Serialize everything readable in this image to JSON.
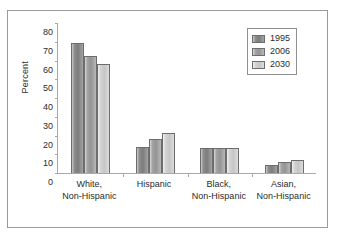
{
  "chart_data": {
    "type": "bar",
    "title": "",
    "xlabel": "",
    "ylabel": "Percent",
    "ylim": [
      0,
      80
    ],
    "yticks": [
      0,
      10,
      20,
      30,
      40,
      50,
      60,
      70,
      80
    ],
    "grid": false,
    "legend_position": "top-right",
    "categories": [
      "White,\nNon-Hispanic",
      "Hispanic",
      "Black,\nNon-Hispanic",
      "Asian,\nNon-Hispanic"
    ],
    "category_lines": [
      [
        "White,",
        "Non-Hispanic"
      ],
      [
        "Hispanic",
        ""
      ],
      [
        "Black,",
        "Non-Hispanic"
      ],
      [
        "Asian,",
        "Non-Hispanic"
      ]
    ],
    "series": [
      {
        "name": "1995",
        "color": "#7c7c7c",
        "values": [
          69,
          14,
          13,
          4
        ]
      },
      {
        "name": "2006",
        "color": "#949494",
        "values": [
          62,
          18,
          13,
          6
        ]
      },
      {
        "name": "2030",
        "color": "#c6c6c6",
        "values": [
          58,
          21,
          13,
          7
        ]
      }
    ]
  },
  "axis": {
    "y_title": "Percent",
    "y_tick_labels": [
      "80",
      "70",
      "60",
      "50",
      "40",
      "30",
      "20",
      "10",
      "0"
    ]
  },
  "legend": {
    "entries": [
      {
        "label": "1995"
      },
      {
        "label": "2006"
      },
      {
        "label": "2030"
      }
    ]
  }
}
